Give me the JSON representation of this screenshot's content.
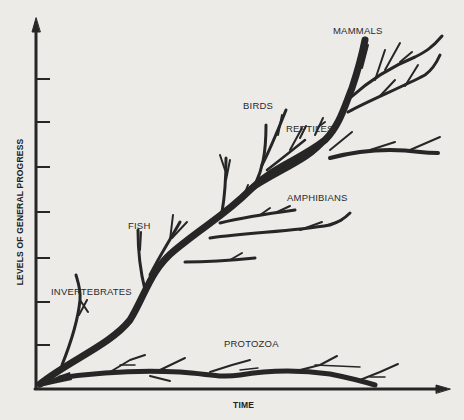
{
  "figure": {
    "type": "evolutionary-progress-tree",
    "x_axis": {
      "label": "TIME"
    },
    "y_axis": {
      "label": "LEVELS OF GENERAL PROGRESS",
      "tick_count": 7
    },
    "labels": {
      "mammals": "MAMMALS",
      "birds": "BIRDS",
      "reptiles": "REPTILES",
      "amphibians": "AMPHIBIANS",
      "fish": "FISH",
      "invertebrates": "INVERTEBRATES",
      "protozoa": "PROTOZOA"
    },
    "colors": {
      "ink": "#262626",
      "paper": "#ecebe8"
    }
  }
}
